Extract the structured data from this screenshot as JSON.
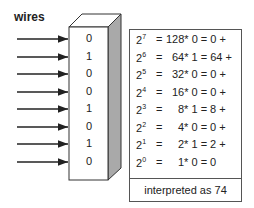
{
  "wires_label": "wires",
  "bits": [
    "0",
    "1",
    "0",
    "0",
    "1",
    "0",
    "1",
    "0"
  ],
  "rows": [
    {
      "base": "2",
      "exp": "7",
      "eq": "=",
      "expr": "128* 0 = 0 +"
    },
    {
      "base": "2",
      "exp": "6",
      "eq": "=",
      "expr": "64* 1 = 64 +"
    },
    {
      "base": "2",
      "exp": "5",
      "eq": "=",
      "expr": "32* 0 = 0 +"
    },
    {
      "base": "2",
      "exp": "4",
      "eq": "=",
      "expr": "16* 0 = 0 +"
    },
    {
      "base": "2",
      "exp": "3",
      "eq": "=",
      "expr": "8* 1 = 8 +"
    },
    {
      "base": "2",
      "exp": "2",
      "eq": "=",
      "expr": "4* 0 = 0 +"
    },
    {
      "base": "2",
      "exp": "1",
      "eq": "=",
      "expr": "2* 1 = 2 +"
    },
    {
      "base": "2",
      "exp": "0",
      "eq": "=",
      "expr": "1* 0 = 0"
    }
  ],
  "footer": "interpreted as 74",
  "colors": {
    "box_side": "#a9a9a9",
    "line": "#333333"
  }
}
